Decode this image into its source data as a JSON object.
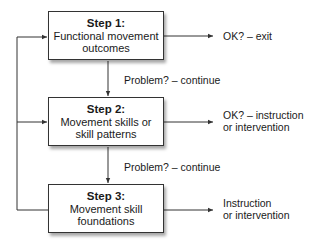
{
  "steps": [
    {
      "title": "Step 1:",
      "line1": "Functional movement",
      "line2": "outcomes"
    },
    {
      "title": "Step 2:",
      "line1": "Movement skills or",
      "line2": "skill patterns"
    },
    {
      "title": "Step 3:",
      "line1": "Movement skill",
      "line2": "foundations"
    }
  ],
  "outcomes": [
    {
      "line1": "OK? – exit",
      "line2": ""
    },
    {
      "line1": "OK? – instruction",
      "line2": "or intervention"
    },
    {
      "line1": "Instruction",
      "line2": "or intervention"
    }
  ],
  "continue_labels": [
    "Problem? – continue",
    "Problem? – continue"
  ],
  "colors": {
    "line": "#333333",
    "box_border": "#333333"
  }
}
